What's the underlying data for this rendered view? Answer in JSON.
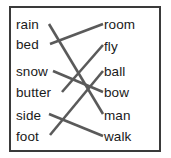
{
  "exercise": {
    "title": "Compound word matching exercise",
    "instruction": "",
    "left_column": {
      "name": "first-word-column",
      "items": [
        {
          "id": "rain",
          "label": "rain",
          "y": 25
        },
        {
          "id": "bed",
          "label": "bed",
          "y": 45
        },
        {
          "id": "snow",
          "label": "snow",
          "y": 72
        },
        {
          "id": "butter",
          "label": "butter",
          "y": 93
        },
        {
          "id": "side",
          "label": "side",
          "y": 116
        },
        {
          "id": "foot",
          "label": "foot",
          "y": 137
        }
      ]
    },
    "right_column": {
      "name": "second-word-column",
      "items": [
        {
          "id": "room",
          "label": "room",
          "y": 25
        },
        {
          "id": "fly",
          "label": "fly",
          "y": 47
        },
        {
          "id": "ball",
          "label": "ball",
          "y": 72
        },
        {
          "id": "bow",
          "label": "bow",
          "y": 93
        },
        {
          "id": "man",
          "label": "man",
          "y": 116
        },
        {
          "id": "walk",
          "label": "walk",
          "y": 137
        }
      ]
    },
    "connections": [
      {
        "from": "bed",
        "to": "room",
        "x1": 50,
        "y1": 44,
        "x2": 103,
        "y2": 24
      },
      {
        "from": "butter",
        "to": "fly",
        "x1": 62,
        "y1": 92,
        "x2": 103,
        "y2": 45
      },
      {
        "from": "foot",
        "to": "ball",
        "x1": 50,
        "y1": 135,
        "x2": 103,
        "y2": 71
      },
      {
        "from": "snow",
        "to": "bow",
        "x1": 53,
        "y1": 71,
        "x2": 103,
        "y2": 92
      },
      {
        "from": "rain",
        "to": "man",
        "x1": 49,
        "y1": 24,
        "x2": 103,
        "y2": 114
      },
      {
        "from": "side",
        "to": "walk",
        "x1": 49,
        "y1": 114,
        "x2": 103,
        "y2": 136
      }
    ],
    "colors": {
      "border": "#3a3a3a",
      "line": "#5a5a5a",
      "text": "#1a1a1a",
      "background": "#ffffff"
    }
  }
}
